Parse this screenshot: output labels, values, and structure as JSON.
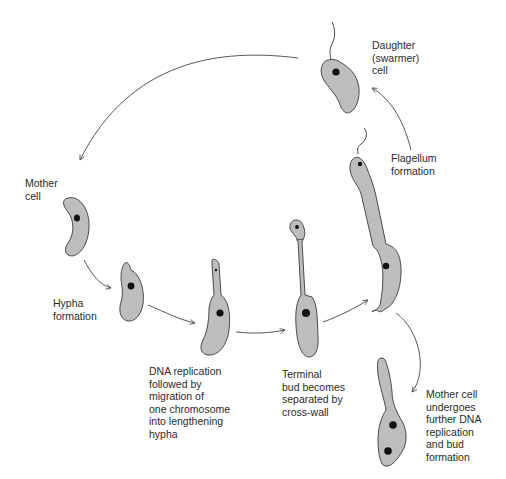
{
  "diagram": {
    "colors": {
      "cell_fill": "#bdbdbd",
      "cell_outline": "#3a3a3a",
      "nucleoid": "#111111",
      "arrow": "#444444"
    },
    "labels": {
      "daughter": "Daughter\n(swarmer)\ncell",
      "flagellum": "Flagellum\nformation",
      "mother": "Mother\ncell",
      "hypha": "Hypha\nformation",
      "dna": "DNA replication\nfollowed by\nmigration of\none chromosome\ninto lengthening\nhypha",
      "terminal": "Terminal\nbud becomes\nseparated by\ncross-wall",
      "mother_further": "Mother cell\nundergoes\nfurther DNA\nreplication\nand bud\nformation"
    },
    "stages": [
      {
        "id": "mother-cell",
        "label_key": "mother"
      },
      {
        "id": "hypha-formation",
        "label_key": "hypha"
      },
      {
        "id": "dna-replication",
        "label_key": "dna"
      },
      {
        "id": "terminal-bud",
        "label_key": "terminal"
      },
      {
        "id": "flagellum-formation",
        "label_key": "flagellum"
      },
      {
        "id": "daughter-swarmer",
        "label_key": "daughter"
      },
      {
        "id": "mother-further-budding",
        "label_key": "mother_further"
      }
    ]
  }
}
